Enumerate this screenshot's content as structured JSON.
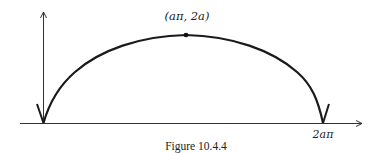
{
  "figure": {
    "caption": "Figure 10.4.4",
    "peak_label": "(aπ, 2a)",
    "end_label": "2aπ",
    "curve": "cycloid arch",
    "colors": {
      "ink": "#222222",
      "background": "#ffffff"
    }
  }
}
